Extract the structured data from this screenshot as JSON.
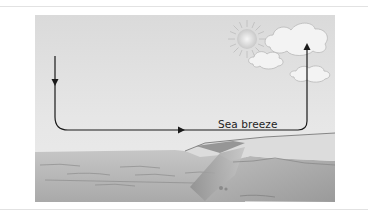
{
  "diagram": {
    "title": "Sea breeze",
    "flow_label": "Sea breeze",
    "elements": [
      "sun",
      "clouds",
      "sea",
      "land",
      "cliff",
      "airflow-arrow"
    ],
    "colors": {
      "sky": "#e4e4e4",
      "sea": "#b9b9b9",
      "land": "#a9a9a9",
      "arrow": "#1a1a1a",
      "cloud": "#f4f4f4"
    }
  }
}
